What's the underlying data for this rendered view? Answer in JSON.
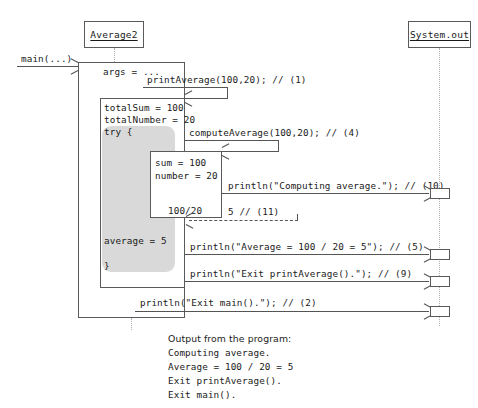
{
  "diagram": {
    "type": "uml-sequence-diagram"
  },
  "participants": [
    {
      "name": "Average2",
      "label": "Average2",
      "underlined": true
    },
    {
      "name": "System.out",
      "label": "System.out",
      "underlined": true
    }
  ],
  "entry": {
    "label": "main(...)"
  },
  "activations": {
    "main": {
      "local_var": "args = ..."
    },
    "printAverage": {
      "locals": [
        "totalSum = 100",
        "totalNumber = 20",
        "try {"
      ],
      "result": "average = 5",
      "close_brace": "}"
    },
    "computeAverage": {
      "locals": [
        "sum = 100",
        "number = 20"
      ],
      "expression": "100/20"
    }
  },
  "messages": [
    {
      "id": "1",
      "label": "printAverage(100,20); // (1)",
      "kind": "call"
    },
    {
      "id": "4",
      "label": "computeAverage(100,20); // (4)",
      "kind": "call"
    },
    {
      "id": "10",
      "label": "println(\"Computing average.\"); // (10)",
      "kind": "call"
    },
    {
      "id": "11",
      "label": "5 // (11)",
      "kind": "return"
    },
    {
      "id": "5",
      "label": "println(\"Average = 100 / 20 = 5\"); // (5)",
      "kind": "call"
    },
    {
      "id": "9",
      "label": "println(\"Exit printAverage().\"); // (9)",
      "kind": "call"
    },
    {
      "id": "2",
      "label": "println(\"Exit main().\"); // (2)",
      "kind": "call"
    }
  ],
  "output_panel": {
    "heading": "Output from the program:",
    "lines": [
      "Computing average.",
      "Average = 100 / 20 = 5",
      "Exit printAverage().",
      "Exit main()."
    ]
  },
  "colors": {
    "stroke": "#555555",
    "box_stroke": "#5a5a5a",
    "try_fill": "#d9d9d9",
    "lifeline": "#b0b0b0",
    "background": "#ffffff",
    "text": "#1a1a1a"
  }
}
